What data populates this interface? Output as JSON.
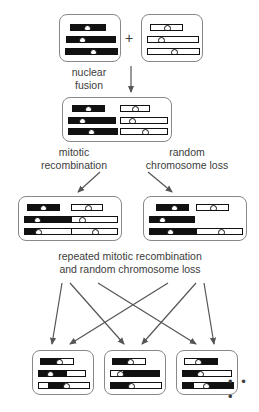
{
  "figure": {
    "labels": {
      "nuclear_fusion": "nuclear\nfusion",
      "mitotic_recombination": "mitotic\nrecombination",
      "random_chromosome_loss": "random\nchromosome loss",
      "repeated": "repeated mitotic recombination\nand random chromosome loss",
      "plus": "+",
      "ellipsis": "• • •"
    },
    "colors": {
      "chromosome_fill_black": "#111111",
      "chromosome_fill_white": "#ffffff",
      "cell_border": "#888888",
      "text": "#3c3c3c",
      "arrow": "#555555"
    },
    "cells": [
      {
        "id": "parent-black",
        "x": 59,
        "y": 14,
        "w": 62,
        "h": 48,
        "chromosomes": [
          {
            "x": 10,
            "y": 9,
            "w": 36,
            "segs": [
              [
                0,
                100,
                "b"
              ]
            ],
            "cen": 47
          },
          {
            "x": 6,
            "y": 21,
            "w": 50,
            "segs": [
              [
                0,
                100,
                "b"
              ]
            ],
            "cen": 30
          },
          {
            "x": 5,
            "y": 33,
            "w": 53,
            "segs": [
              [
                0,
                100,
                "b"
              ]
            ],
            "cen": 52
          }
        ]
      },
      {
        "id": "parent-white",
        "x": 141,
        "y": 14,
        "w": 62,
        "h": 48,
        "chromosomes": [
          {
            "x": 8,
            "y": 9,
            "w": 33,
            "segs": [
              [
                0,
                100,
                "w"
              ]
            ],
            "cen": 50
          },
          {
            "x": 5,
            "y": 21,
            "w": 52,
            "segs": [
              [
                0,
                100,
                "w"
              ]
            ],
            "cen": 24
          },
          {
            "x": 5,
            "y": 33,
            "w": 53,
            "segs": [
              [
                0,
                100,
                "w"
              ]
            ],
            "cen": 50
          }
        ]
      },
      {
        "id": "fused",
        "x": 62,
        "y": 97,
        "w": 110,
        "h": 45,
        "chromosomes": [
          {
            "x": 9,
            "y": 7,
            "w": 33,
            "segs": [
              [
                0,
                100,
                "b"
              ]
            ],
            "cen": 48
          },
          {
            "x": 5,
            "y": 19,
            "w": 48,
            "segs": [
              [
                0,
                100,
                "b"
              ]
            ],
            "cen": 28
          },
          {
            "x": 5,
            "y": 30,
            "w": 50,
            "segs": [
              [
                0,
                100,
                "b"
              ]
            ],
            "cen": 45
          },
          {
            "x": 57,
            "y": 7,
            "w": 30,
            "segs": [
              [
                0,
                100,
                "w"
              ]
            ],
            "cen": 48
          },
          {
            "x": 57,
            "y": 19,
            "w": 48,
            "segs": [
              [
                0,
                100,
                "w"
              ]
            ],
            "cen": 22
          },
          {
            "x": 57,
            "y": 30,
            "w": 48,
            "segs": [
              [
                0,
                100,
                "w"
              ]
            ],
            "cen": 50
          }
        ]
      },
      {
        "id": "daughter-left",
        "x": 18,
        "y": 196,
        "w": 104,
        "h": 45,
        "chromosomes": [
          {
            "x": 8,
            "y": 7,
            "w": 33,
            "segs": [
              [
                0,
                100,
                "b"
              ]
            ],
            "cen": 48
          },
          {
            "x": 5,
            "y": 19,
            "w": 48,
            "segs": [
              [
                0,
                100,
                "b"
              ]
            ],
            "cen": 26
          },
          {
            "x": 5,
            "y": 31,
            "w": 50,
            "segs": [
              [
                0,
                28,
                "b"
              ],
              [
                28,
                100,
                "w"
              ]
            ],
            "cen": 26
          },
          {
            "x": 52,
            "y": 7,
            "w": 32,
            "segs": [
              [
                0,
                100,
                "w"
              ]
            ],
            "cen": 50
          },
          {
            "x": 52,
            "y": 19,
            "w": 47,
            "segs": [
              [
                0,
                100,
                "w"
              ]
            ],
            "cen": 22
          },
          {
            "x": 52,
            "y": 31,
            "w": 47,
            "segs": [
              [
                0,
                100,
                "w"
              ]
            ],
            "cen": 50
          }
        ]
      },
      {
        "id": "daughter-right",
        "x": 143,
        "y": 196,
        "w": 104,
        "h": 45,
        "chromosomes": [
          {
            "x": 12,
            "y": 7,
            "w": 33,
            "segs": [
              [
                0,
                100,
                "b"
              ]
            ],
            "cen": 52
          },
          {
            "x": 5,
            "y": 19,
            "w": 46,
            "segs": [
              [
                0,
                100,
                "b"
              ]
            ],
            "cen": 26
          },
          {
            "x": 5,
            "y": 31,
            "w": 50,
            "segs": [
              [
                0,
                100,
                "b"
              ]
            ],
            "cen": 40
          },
          {
            "x": 52,
            "y": 7,
            "w": 33,
            "segs": [
              [
                0,
                100,
                "w"
              ]
            ],
            "cen": 50
          },
          {
            "x": 52,
            "y": 31,
            "w": 47,
            "segs": [
              [
                0,
                100,
                "w"
              ]
            ],
            "cen": 52
          }
        ]
      },
      {
        "id": "final-1",
        "x": 32,
        "y": 350,
        "w": 62,
        "h": 45,
        "chromosomes": [
          {
            "x": 7,
            "y": 7,
            "w": 34,
            "segs": [
              [
                0,
                62,
                "b"
              ],
              [
                62,
                100,
                "w"
              ]
            ],
            "cen": 55
          },
          {
            "x": 5,
            "y": 19,
            "w": 48,
            "segs": [
              [
                0,
                20,
                "b"
              ],
              [
                20,
                60,
                "b"
              ],
              [
                60,
                100,
                "w"
              ]
            ],
            "cen": 22
          },
          {
            "x": 5,
            "y": 31,
            "w": 52,
            "segs": [
              [
                0,
                18,
                "w"
              ],
              [
                18,
                52,
                "b"
              ],
              [
                52,
                100,
                "w"
              ]
            ],
            "cen": 52
          }
        ]
      },
      {
        "id": "final-2",
        "x": 104,
        "y": 350,
        "w": 62,
        "h": 45,
        "chromosomes": [
          {
            "x": 7,
            "y": 7,
            "w": 34,
            "segs": [
              [
                0,
                50,
                "b"
              ],
              [
                50,
                100,
                "w"
              ]
            ],
            "cen": 52
          },
          {
            "x": 5,
            "y": 19,
            "w": 50,
            "segs": [
              [
                0,
                25,
                "w"
              ],
              [
                25,
                72,
                "b"
              ],
              [
                72,
                100,
                "b"
              ]
            ],
            "cen": 18
          },
          {
            "x": 5,
            "y": 31,
            "w": 52,
            "segs": [
              [
                0,
                40,
                "b"
              ],
              [
                40,
                100,
                "w"
              ]
            ],
            "cen": 38
          }
        ]
      },
      {
        "id": "final-3",
        "x": 176,
        "y": 350,
        "w": 62,
        "h": 45,
        "chromosomes": [
          {
            "x": 7,
            "y": 7,
            "w": 34,
            "segs": [
              [
                0,
                38,
                "w"
              ],
              [
                38,
                100,
                "b"
              ]
            ],
            "cen": 40
          },
          {
            "x": 5,
            "y": 19,
            "w": 50,
            "segs": [
              [
                0,
                35,
                "b"
              ],
              [
                35,
                100,
                "w"
              ]
            ],
            "cen": 34
          },
          {
            "x": 5,
            "y": 31,
            "w": 52,
            "segs": [
              [
                0,
                22,
                "b"
              ],
              [
                22,
                48,
                "w"
              ],
              [
                48,
                100,
                "b"
              ]
            ],
            "cen": 44
          }
        ]
      }
    ],
    "arrows": [
      {
        "name": "fusion-arrow",
        "x1": 131,
        "y1": 66,
        "x2": 131,
        "y2": 92
      },
      {
        "name": "mitotic-arrow",
        "x1": 100,
        "y1": 172,
        "x2": 78,
        "y2": 192
      },
      {
        "name": "loss-arrow",
        "x1": 148,
        "y1": 172,
        "x2": 172,
        "y2": 192
      },
      {
        "name": "fan-left-1",
        "x1": 62,
        "y1": 283,
        "x2": 52,
        "y2": 344
      },
      {
        "name": "fan-left-2",
        "x1": 70,
        "y1": 283,
        "x2": 124,
        "y2": 344
      },
      {
        "name": "fan-left-3",
        "x1": 98,
        "y1": 283,
        "x2": 196,
        "y2": 344
      },
      {
        "name": "fan-right-1",
        "x1": 168,
        "y1": 283,
        "x2": 70,
        "y2": 344
      },
      {
        "name": "fan-right-2",
        "x1": 196,
        "y1": 283,
        "x2": 142,
        "y2": 344
      },
      {
        "name": "fan-right-3",
        "x1": 204,
        "y1": 283,
        "x2": 214,
        "y2": 344
      }
    ],
    "texts": [
      {
        "name": "label-nuclear-fusion",
        "key": "nuclear_fusion",
        "x": 58,
        "y": 66,
        "w": 62
      },
      {
        "name": "label-mitotic-recomb",
        "key": "mitotic_recombination",
        "x": 22,
        "y": 146,
        "w": 104
      },
      {
        "name": "label-random-loss",
        "key": "random_chromosome_loss",
        "x": 128,
        "y": 146,
        "w": 118
      },
      {
        "name": "label-repeated",
        "key": "repeated",
        "x": 10,
        "y": 250,
        "w": 240
      }
    ]
  }
}
